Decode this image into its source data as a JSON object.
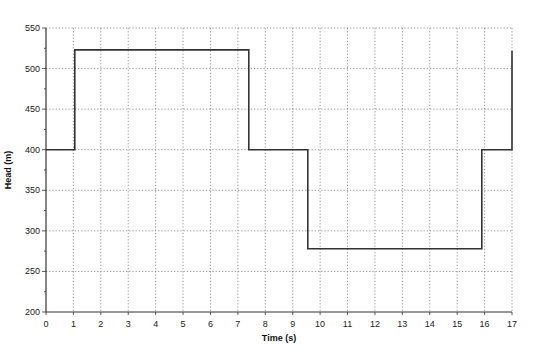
{
  "chart_data": {
    "type": "line",
    "title": "",
    "xlabel": "Time (s)",
    "ylabel": "Head (m)",
    "xlim": [
      0,
      17
    ],
    "ylim": [
      200,
      550
    ],
    "x_ticks": [
      0,
      1,
      2,
      3,
      4,
      5,
      6,
      7,
      8,
      9,
      10,
      11,
      12,
      13,
      14,
      15,
      16,
      17
    ],
    "y_ticks": [
      200,
      250,
      300,
      350,
      400,
      450,
      500,
      550
    ],
    "y_minor_step": 25,
    "grid": true,
    "grid_style": "dotted",
    "legend": null,
    "line_color": "#333333",
    "series": [
      {
        "name": "Head",
        "step": true,
        "points": [
          {
            "t": 0.0,
            "v": 400
          },
          {
            "t": 1.05,
            "v": 400
          },
          {
            "t": 1.05,
            "v": 523
          },
          {
            "t": 7.4,
            "v": 523
          },
          {
            "t": 7.4,
            "v": 400
          },
          {
            "t": 9.55,
            "v": 400
          },
          {
            "t": 9.55,
            "v": 278
          },
          {
            "t": 15.9,
            "v": 278
          },
          {
            "t": 15.9,
            "v": 400
          },
          {
            "t": 17.0,
            "v": 400
          },
          {
            "t": 17.0,
            "v": 522
          }
        ]
      }
    ]
  }
}
